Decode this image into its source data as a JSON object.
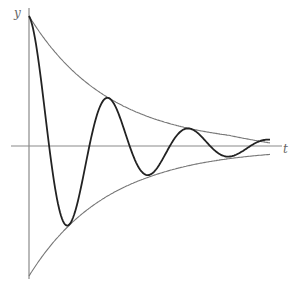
{
  "diagram": {
    "axes": {
      "x_label": "t",
      "y_label": "y"
    },
    "colors": {
      "axis": "#8a8a8a",
      "envelope": "#777777",
      "curve": "#222222",
      "background": "#ffffff"
    }
  },
  "chart_data": {
    "type": "line",
    "title": "",
    "xlabel": "t",
    "ylabel": "y",
    "grid": false,
    "series": [
      {
        "name": "damped oscillation",
        "x": [
          0,
          39,
          80,
          120,
          158,
          200,
          241
        ],
        "y": [
          130,
          -73,
          49,
          -28,
          20,
          -9,
          5
        ]
      },
      {
        "name": "upper envelope",
        "x": [
          0,
          80,
          158,
          241
        ],
        "y": [
          130,
          49,
          20,
          6
        ]
      },
      {
        "name": "lower envelope",
        "x": [
          0,
          80,
          158,
          241
        ],
        "y": [
          -130,
          -49,
          -20,
          -4
        ]
      }
    ],
    "zero_crossings_x": [
      19,
      60,
      102,
      139,
      179,
      221
    ],
    "pixel_mapping": {
      "origin_x": 29,
      "origin_y": 146,
      "x_end": 270
    }
  }
}
